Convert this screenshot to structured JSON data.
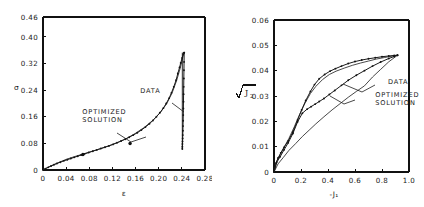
{
  "figure": {
    "panels": [
      "left",
      "right"
    ]
  },
  "chart_data": [
    {
      "id": "left",
      "type": "line",
      "title": "",
      "xlabel": "ε",
      "ylabel": "σ",
      "xlim": [
        0,
        0.28
      ],
      "ylim": [
        0,
        0.46
      ],
      "xticks": [
        "0",
        "0.04",
        "0.08",
        "0.12",
        "0.16",
        "0.20",
        "0.24",
        "0.28"
      ],
      "xtick_values": [
        0,
        0.04,
        0.08,
        0.12,
        0.16,
        0.2,
        0.24,
        0.28
      ],
      "yticks": [
        "0",
        "0.08",
        "0.16",
        "0.24",
        "0.32",
        "0.40",
        "0.46"
      ],
      "ytick_values": [
        0,
        0.08,
        0.16,
        0.24,
        0.32,
        0.4,
        0.46
      ],
      "grid": false,
      "legend_position": "inline-annotations",
      "annotations": [
        {
          "text": "DATA",
          "x": 0.168,
          "y": 0.233
        },
        {
          "text": "OPTIMIZED",
          "x": 0.068,
          "y": 0.168
        },
        {
          "text": "SOLUTION",
          "x": 0.068,
          "y": 0.145
        }
      ],
      "series": [
        {
          "name": "DATA",
          "marker": "dot",
          "x": [
            0.0,
            0.004,
            0.009,
            0.014,
            0.019,
            0.024,
            0.03,
            0.036,
            0.042,
            0.048,
            0.054,
            0.06,
            0.066,
            0.072,
            0.079,
            0.086,
            0.093,
            0.1,
            0.107,
            0.114,
            0.121,
            0.128,
            0.135,
            0.142,
            0.149,
            0.156,
            0.163,
            0.17,
            0.177,
            0.184,
            0.19,
            0.196,
            0.202,
            0.208,
            0.213,
            0.218,
            0.222,
            0.226,
            0.23,
            0.233,
            0.236,
            0.238,
            0.2405,
            0.2425,
            0.2435,
            0.244
          ],
          "y": [
            0.0,
            0.004,
            0.008,
            0.012,
            0.016,
            0.0195,
            0.0235,
            0.0275,
            0.031,
            0.0345,
            0.038,
            0.0415,
            0.045,
            0.0485,
            0.0525,
            0.0565,
            0.0605,
            0.0645,
            0.0685,
            0.0725,
            0.077,
            0.082,
            0.087,
            0.0925,
            0.0985,
            0.105,
            0.112,
            0.12,
            0.129,
            0.139,
            0.149,
            0.16,
            0.172,
            0.186,
            0.2,
            0.216,
            0.232,
            0.25,
            0.27,
            0.29,
            0.308,
            0.322,
            0.337,
            0.348,
            0.352,
            0.353
          ]
        },
        {
          "name": "DATA-unload",
          "marker": "dot",
          "x": [
            0.244,
            0.2438,
            0.2436,
            0.2434,
            0.2432,
            0.243,
            0.2428,
            0.2426,
            0.2424,
            0.2422,
            0.242,
            0.2418,
            0.2416,
            0.2414,
            0.2412,
            0.241,
            0.2409,
            0.2408
          ],
          "y": [
            0.353,
            0.325,
            0.3,
            0.275,
            0.25,
            0.228,
            0.205,
            0.185,
            0.165,
            0.148,
            0.132,
            0.118,
            0.105,
            0.095,
            0.086,
            0.078,
            0.07,
            0.063
          ]
        },
        {
          "name": "OPTIMIZED SOLUTION",
          "marker": "none",
          "x": [
            0.0,
            0.012,
            0.025,
            0.04,
            0.055,
            0.07,
            0.085,
            0.1,
            0.115,
            0.13,
            0.145,
            0.16,
            0.175,
            0.19,
            0.203,
            0.214,
            0.223,
            0.231,
            0.237,
            0.241,
            0.2435
          ],
          "y": [
            0.0,
            0.011,
            0.021,
            0.032,
            0.0405,
            0.0485,
            0.0565,
            0.0645,
            0.0735,
            0.0835,
            0.0955,
            0.1105,
            0.128,
            0.1495,
            0.173,
            0.2,
            0.231,
            0.269,
            0.305,
            0.335,
            0.352
          ]
        }
      ],
      "highlight_points": [
        {
          "x": 0.069,
          "y": 0.0465
        },
        {
          "x": 0.1505,
          "y": 0.0795
        }
      ],
      "error_bar": {
        "x": 0.2408,
        "y_low": 0.063,
        "y_high": 0.353
      }
    },
    {
      "id": "right",
      "type": "line",
      "title": "",
      "xlabel": "-J₁",
      "ylabel": "√J₂",
      "xlim": [
        0,
        1.0
      ],
      "ylim": [
        0,
        0.06
      ],
      "xticks": [
        "0",
        "0.2",
        "0.4",
        "0.6",
        "0.8",
        "1.0"
      ],
      "xtick_values": [
        0,
        0.2,
        0.4,
        0.6,
        0.8,
        1.0
      ],
      "yticks": [
        "0",
        "0.01",
        "0.02",
        "0.03",
        "0.04",
        "0.05",
        "0.06"
      ],
      "ytick_values": [
        0,
        0.01,
        0.02,
        0.03,
        0.04,
        0.05,
        0.06
      ],
      "grid": false,
      "legend_position": "inline-annotations",
      "annotations": [
        {
          "text": "DATA",
          "x": 0.845,
          "y": 0.0348
        },
        {
          "text": "OPTIMIZED",
          "x": 0.75,
          "y": 0.0298
        },
        {
          "text": "SOLUTION",
          "x": 0.75,
          "y": 0.0265
        }
      ],
      "series": [
        {
          "name": "DATA-upper",
          "marker": "dot",
          "x": [
            0.0,
            0.015,
            0.03,
            0.05,
            0.075,
            0.105,
            0.14,
            0.175,
            0.205,
            0.235,
            0.27,
            0.3,
            0.335,
            0.375,
            0.415,
            0.455,
            0.5,
            0.55,
            0.6,
            0.65,
            0.7,
            0.75,
            0.8,
            0.85,
            0.89,
            0.915
          ],
          "y": [
            0.0,
            0.0035,
            0.0055,
            0.0075,
            0.0098,
            0.0122,
            0.0158,
            0.0205,
            0.0245,
            0.0282,
            0.0318,
            0.0345,
            0.0368,
            0.0385,
            0.0398,
            0.0408,
            0.0418,
            0.0428,
            0.0436,
            0.0442,
            0.0447,
            0.0451,
            0.0455,
            0.0458,
            0.046,
            0.0461
          ]
        },
        {
          "name": "OPT-upper",
          "marker": "none",
          "x": [
            0.0,
            0.02,
            0.045,
            0.075,
            0.11,
            0.15,
            0.19,
            0.23,
            0.27,
            0.31,
            0.36,
            0.41,
            0.46,
            0.52,
            0.58,
            0.64,
            0.7,
            0.76,
            0.82,
            0.88,
            0.915
          ],
          "y": [
            0.0,
            0.0042,
            0.0068,
            0.0098,
            0.0132,
            0.0178,
            0.0228,
            0.0272,
            0.031,
            0.0338,
            0.0365,
            0.0385,
            0.0398,
            0.041,
            0.0421,
            0.043,
            0.0438,
            0.0446,
            0.0452,
            0.0458,
            0.0461
          ]
        },
        {
          "name": "DATA-lower",
          "marker": "dot",
          "x": [
            0.0,
            0.02,
            0.045,
            0.075,
            0.105,
            0.14,
            0.175,
            0.21,
            0.245,
            0.275,
            0.305,
            0.335,
            0.37,
            0.41,
            0.45,
            0.5,
            0.55,
            0.61,
            0.67,
            0.73,
            0.79,
            0.85,
            0.89,
            0.915
          ],
          "y": [
            0.0,
            0.0038,
            0.006,
            0.0088,
            0.0115,
            0.0152,
            0.0198,
            0.0232,
            0.0248,
            0.0258,
            0.0268,
            0.0278,
            0.029,
            0.0306,
            0.0322,
            0.0342,
            0.0362,
            0.0382,
            0.04,
            0.0418,
            0.0434,
            0.0448,
            0.0456,
            0.0461
          ]
        },
        {
          "name": "OPT-lower",
          "marker": "none",
          "x": [
            0.0,
            0.03,
            0.07,
            0.11,
            0.16,
            0.21,
            0.26,
            0.31,
            0.37,
            0.43,
            0.49,
            0.55,
            0.61,
            0.67,
            0.73,
            0.79,
            0.85,
            0.915
          ],
          "y": [
            0.0,
            0.0032,
            0.0058,
            0.0085,
            0.0112,
            0.014,
            0.0165,
            0.019,
            0.0218,
            0.0245,
            0.027,
            0.0295,
            0.0318,
            0.034,
            0.0375,
            0.0405,
            0.0435,
            0.0461
          ]
        }
      ]
    }
  ]
}
